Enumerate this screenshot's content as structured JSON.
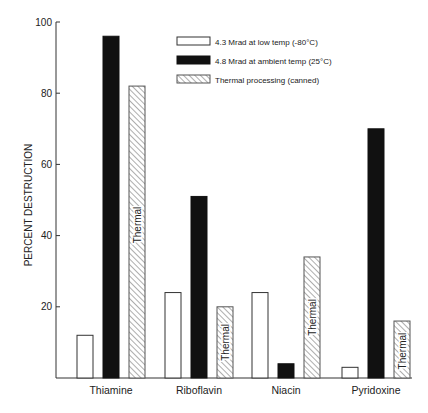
{
  "chart_data": {
    "type": "bar",
    "title": "",
    "xlabel": "",
    "ylabel": "PERCENT DESTRUCTION",
    "ylim": [
      0,
      100
    ],
    "yticks": [
      20,
      40,
      60,
      80,
      100
    ],
    "grid": false,
    "legend_position": "top-right (inside plot)",
    "categories": [
      "Thiamine",
      "Riboflavin",
      "Niacin",
      "Pyridoxine"
    ],
    "series": [
      {
        "name": "4.3 Mrad  at low temp (-80°C)",
        "style": "white",
        "values": [
          12,
          24,
          24,
          3
        ]
      },
      {
        "name": "4.8 Mrad  at ambient temp (25°C)",
        "style": "black",
        "values": [
          96,
          51,
          4,
          70
        ]
      },
      {
        "name": "Thermal processing (canned)",
        "style": "hatched",
        "values": [
          82,
          20,
          34,
          16
        ]
      }
    ],
    "annotations": [
      {
        "text": "Thermal",
        "category": "Thiamine",
        "series": 2
      },
      {
        "text": "Thermal",
        "category": "Riboflavin",
        "series": 2
      },
      {
        "text": "Thermal",
        "category": "Niacin",
        "series": 2
      },
      {
        "text": "Thermal",
        "category": "Pyridoxine",
        "series": 2
      }
    ]
  },
  "colors": {
    "axis": "#333333",
    "black_bar": "#111111",
    "hatch": "#555555",
    "outline": "#333333"
  }
}
